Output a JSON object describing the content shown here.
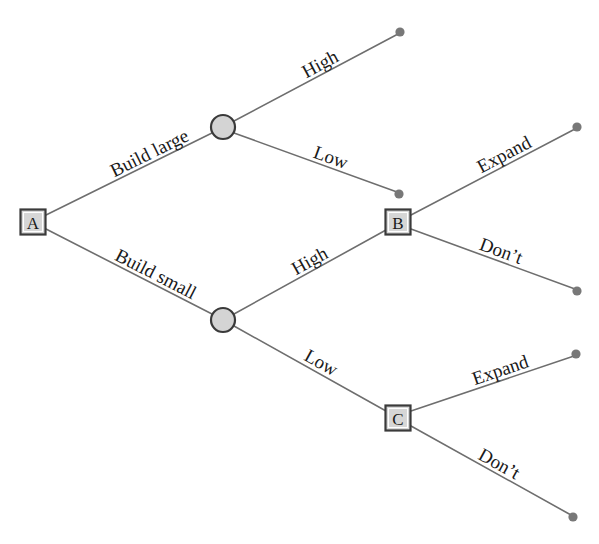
{
  "diagram": {
    "type": "decision-tree",
    "colors": {
      "line": "#6e6e6e",
      "terminal_dot": "#787878",
      "node_fill": "#d6d6d6",
      "node_stroke": "#3a3a3a",
      "background": "#ffffff",
      "text": "#1a1a1a"
    },
    "nodes": [
      {
        "id": "A",
        "label": "A",
        "shape": "square",
        "kind": "decision",
        "x": 33,
        "y": 222
      },
      {
        "id": "chance-upper",
        "label": "",
        "shape": "circle",
        "kind": "chance",
        "x": 223,
        "y": 127
      },
      {
        "id": "chance-lower",
        "label": "",
        "shape": "circle",
        "kind": "chance",
        "x": 223,
        "y": 320
      },
      {
        "id": "B",
        "label": "B",
        "shape": "square",
        "kind": "decision",
        "x": 398,
        "y": 222
      },
      {
        "id": "C",
        "label": "C",
        "shape": "square",
        "kind": "decision",
        "x": 398,
        "y": 418
      }
    ],
    "terminals": [
      {
        "id": "t1",
        "x": 400,
        "y": 32
      },
      {
        "id": "t2",
        "x": 399,
        "y": 194
      },
      {
        "id": "t3",
        "x": 577,
        "y": 127
      },
      {
        "id": "t4",
        "x": 577,
        "y": 291
      },
      {
        "id": "t5",
        "x": 576,
        "y": 354
      },
      {
        "id": "t6",
        "x": 573,
        "y": 517
      }
    ],
    "edges": [
      {
        "id": "e-build-large",
        "from": "A",
        "to": "chance-upper",
        "label": "Build large",
        "x1": 46,
        "y1": 215,
        "x2": 212,
        "y2": 133,
        "label_t": 0.42,
        "label_offset": -20
      },
      {
        "id": "e-build-small",
        "from": "A",
        "to": "chance-lower",
        "label": "Build small",
        "x1": 46,
        "y1": 229,
        "x2": 212,
        "y2": 314,
        "label_t": 0.4,
        "label_offset": -20
      },
      {
        "id": "e-upper-high",
        "from": "chance-upper",
        "to": "t1",
        "label": "High",
        "x1": 234,
        "y1": 121,
        "x2": 398,
        "y2": 34,
        "label_t": 0.45,
        "label_offset": -20
      },
      {
        "id": "e-upper-low",
        "from": "chance-upper",
        "to": "t2",
        "label": "Low",
        "x1": 234,
        "y1": 133,
        "x2": 397,
        "y2": 192,
        "label_t": 0.47,
        "label_offset": -20
      },
      {
        "id": "e-lower-high",
        "from": "chance-lower",
        "to": "B",
        "label": "High",
        "x1": 234,
        "y1": 314,
        "x2": 386,
        "y2": 230,
        "label_t": 0.42,
        "label_offset": -20
      },
      {
        "id": "e-lower-low",
        "from": "chance-lower",
        "to": "C",
        "label": "Low",
        "x1": 234,
        "y1": 326,
        "x2": 386,
        "y2": 411,
        "label_t": 0.44,
        "label_offset": -20
      },
      {
        "id": "e-b-expand",
        "from": "B",
        "to": "t3",
        "label": "Expand",
        "x1": 411,
        "y1": 215,
        "x2": 575,
        "y2": 129,
        "label_t": 0.44,
        "label_offset": -20
      },
      {
        "id": "e-b-dont",
        "from": "B",
        "to": "t4",
        "label": "Don’t",
        "x1": 411,
        "y1": 229,
        "x2": 575,
        "y2": 289,
        "label_t": 0.4,
        "label_offset": -20
      },
      {
        "id": "e-c-expand",
        "from": "C",
        "to": "t5",
        "label": "Expand",
        "x1": 411,
        "y1": 411,
        "x2": 574,
        "y2": 356,
        "label_t": 0.4,
        "label_offset": -20
      },
      {
        "id": "e-c-dont",
        "from": "C",
        "to": "t6",
        "label": "Don’t",
        "x1": 411,
        "y1": 426,
        "x2": 571,
        "y2": 515,
        "label_t": 0.4,
        "label_offset": -20
      }
    ]
  }
}
